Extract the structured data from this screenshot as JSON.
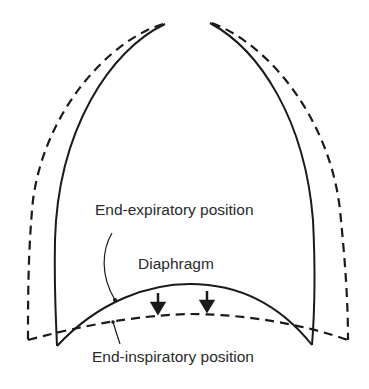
{
  "diagram": {
    "labels": {
      "end_expiratory": "End-expiratory position",
      "diaphragm": "Diaphragm",
      "end_inspiratory": "End-inspiratory position"
    },
    "legend": {
      "solid_line": "End-expiratory position",
      "dashed_line": "End-inspiratory position"
    },
    "colors": {
      "stroke": "#1a1a1a",
      "text": "#2a2a2a",
      "background": "#ffffff"
    }
  }
}
